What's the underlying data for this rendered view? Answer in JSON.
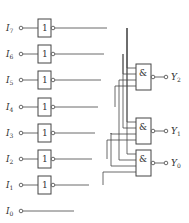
{
  "diagram": {
    "inputs": [
      {
        "name": "I",
        "sub": "7"
      },
      {
        "name": "I",
        "sub": "6"
      },
      {
        "name": "I",
        "sub": "5"
      },
      {
        "name": "I",
        "sub": "4"
      },
      {
        "name": "I",
        "sub": "3"
      },
      {
        "name": "I",
        "sub": "2"
      },
      {
        "name": "I",
        "sub": "1"
      },
      {
        "name": "I",
        "sub": "0"
      }
    ],
    "inverter_symbol": "1",
    "nand_symbol": "&",
    "outputs": [
      {
        "name": "Y",
        "sub": "2"
      },
      {
        "name": "Y",
        "sub": "1"
      },
      {
        "name": "Y",
        "sub": "0"
      }
    ],
    "connections": {
      "Y2": [
        "I7",
        "I6",
        "I5",
        "I4"
      ],
      "Y1": [
        "I7",
        "I6",
        "I3",
        "I2"
      ],
      "Y0": [
        "I7",
        "I5",
        "I3",
        "I1"
      ]
    },
    "colors": {
      "line": "#444444",
      "text": "#333333",
      "background": "#ffffff"
    }
  }
}
